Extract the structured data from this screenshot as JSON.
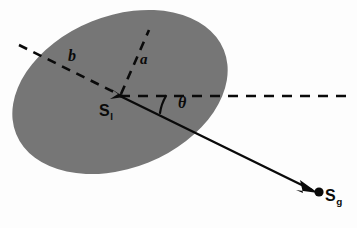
{
  "figure": {
    "kind": "geometry-diagram",
    "title": "",
    "background_color": "#fdfdfd",
    "ink_color": "#0a0a0a"
  },
  "shape": {
    "name": "ellipse",
    "fill_color": "#767676",
    "center_x": 120,
    "center_y": 96,
    "semi_major": 112,
    "semi_minor": 76,
    "rotation_deg": -22
  },
  "axes": {
    "semi_minor_label": "a",
    "semi_major_label": "b"
  },
  "angle": {
    "label": "θ"
  },
  "points": {
    "start": {
      "symbol": "S",
      "subscript": "l"
    },
    "goal": {
      "symbol": "S",
      "subscript": "g"
    }
  }
}
